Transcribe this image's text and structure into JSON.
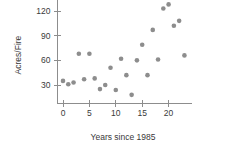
{
  "chart_data": {
    "type": "scatter",
    "title": "",
    "xlabel": "Years since 1985",
    "ylabel": "Acres/Fire",
    "xlim": [
      -1.2,
      24.5
    ],
    "ylim": [
      8,
      133
    ],
    "xticks": [
      0,
      5,
      10,
      15,
      20
    ],
    "xtick_labels": [
      "0",
      "5",
      "10",
      "15",
      "20"
    ],
    "yticks": [
      30,
      60,
      90,
      120
    ],
    "ytick_labels": [
      "30",
      "60",
      "90",
      "120"
    ],
    "grid": false,
    "legend": "none",
    "marker_color": "#8d8d8d",
    "marker_size": 4.6,
    "axis_color": "#8d8d8d",
    "x": [
      0,
      1,
      2,
      3,
      4,
      5,
      6,
      7,
      8,
      9,
      10,
      11,
      12,
      13,
      14,
      15,
      16,
      17,
      18,
      19,
      20,
      21,
      22,
      23
    ],
    "y": [
      35,
      31,
      33,
      68,
      37,
      68,
      38,
      25,
      30,
      51,
      24,
      62,
      42,
      18,
      60,
      79,
      42,
      97,
      61,
      123,
      128,
      102,
      108,
      66
    ],
    "points": [
      {
        "x": 0,
        "y": 35
      },
      {
        "x": 1,
        "y": 31
      },
      {
        "x": 2,
        "y": 33
      },
      {
        "x": 3,
        "y": 68
      },
      {
        "x": 4,
        "y": 37
      },
      {
        "x": 5,
        "y": 68
      },
      {
        "x": 6,
        "y": 38
      },
      {
        "x": 7,
        "y": 25
      },
      {
        "x": 8,
        "y": 30
      },
      {
        "x": 9,
        "y": 51
      },
      {
        "x": 10,
        "y": 24
      },
      {
        "x": 11,
        "y": 62
      },
      {
        "x": 12,
        "y": 42
      },
      {
        "x": 13,
        "y": 18
      },
      {
        "x": 14,
        "y": 60
      },
      {
        "x": 15,
        "y": 79
      },
      {
        "x": 16,
        "y": 42
      },
      {
        "x": 17,
        "y": 97
      },
      {
        "x": 18,
        "y": 61
      },
      {
        "x": 19,
        "y": 123
      },
      {
        "x": 20,
        "y": 128
      },
      {
        "x": 21,
        "y": 102
      },
      {
        "x": 22,
        "y": 108
      },
      {
        "x": 23,
        "y": 66
      }
    ]
  }
}
